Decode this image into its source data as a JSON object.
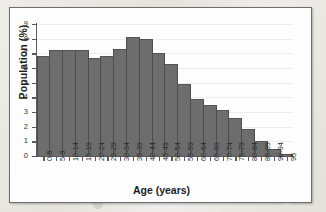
{
  "chart_data": {
    "type": "bar",
    "title": "",
    "xlabel": "Age (years)",
    "ylabel": "Population (%)",
    "ylim": [
      0,
      9
    ],
    "yticks": [
      0,
      1,
      2,
      3,
      4,
      5,
      6,
      7,
      8,
      9
    ],
    "ytick_labels": [
      "0",
      "1",
      "2",
      "3",
      "4",
      "5",
      "6",
      "7",
      "8",
      "9"
    ],
    "grid": "horizontal",
    "legend": "none",
    "categories": [
      "0-5",
      "5-9",
      "10-14",
      "15-19",
      "20-24",
      "25-29",
      "30-34",
      "35-39",
      "40-44",
      "45-49",
      "50-54",
      "55-59",
      "60-64",
      "65-69",
      "70-74",
      "75-79",
      "80-84",
      "85-89",
      "90-94",
      "95"
    ],
    "values": [
      6.8,
      7.25,
      7.25,
      7.2,
      6.7,
      6.85,
      7.3,
      8.1,
      7.95,
      7.05,
      6.3,
      4.9,
      3.9,
      3.45,
      3.15,
      2.6,
      1.85,
      1.0,
      0.45,
      0.15
    ],
    "bar_color": "#6d6d6d",
    "bar_edge_color": "#4d4d4d",
    "axis_color": "#5a5a5a",
    "grid_color": "#ededed",
    "plot_background": "#fdfdfd"
  }
}
